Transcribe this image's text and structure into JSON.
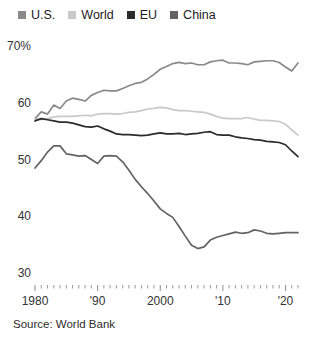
{
  "legend": {
    "items": [
      {
        "label": "U.S.",
        "color": "#8a8a8a",
        "key": "us"
      },
      {
        "label": "World",
        "color": "#c9c9c9",
        "key": "world"
      },
      {
        "label": "EU",
        "color": "#2b2b2b",
        "key": "eu"
      },
      {
        "label": "China",
        "color": "#636363",
        "key": "china"
      }
    ]
  },
  "source": "Source: World Bank",
  "chart_data": {
    "type": "line",
    "title": "",
    "subtitle": "",
    "xlabel": "",
    "ylabel": "",
    "xlim": [
      1980,
      2022
    ],
    "ylim": [
      30,
      70
    ],
    "grid": false,
    "legend_position": "top-left",
    "y_ticks": [
      {
        "value": 70,
        "label": "70%"
      },
      {
        "value": 60,
        "label": "60"
      },
      {
        "value": 50,
        "label": "50"
      },
      {
        "value": 40,
        "label": "40"
      },
      {
        "value": 30,
        "label": "30"
      }
    ],
    "x_ticks": [
      {
        "value": 1980,
        "label": "1980"
      },
      {
        "value": 1990,
        "label": "'90"
      },
      {
        "value": 2000,
        "label": "2000"
      },
      {
        "value": 2010,
        "label": "'10"
      },
      {
        "value": 2020,
        "label": "'20"
      }
    ],
    "x": [
      1980,
      1981,
      1982,
      1983,
      1984,
      1985,
      1986,
      1987,
      1988,
      1989,
      1990,
      1991,
      1992,
      1993,
      1994,
      1995,
      1996,
      1997,
      1998,
      1999,
      2000,
      2001,
      2002,
      2003,
      2004,
      2005,
      2006,
      2007,
      2008,
      2009,
      2010,
      2011,
      2012,
      2013,
      2014,
      2015,
      2016,
      2017,
      2018,
      2019,
      2020,
      2021,
      2022
    ],
    "series": [
      {
        "name": "U.S.",
        "color": "#8a8a8a",
        "values": [
          57.2,
          58.4,
          58.0,
          59.6,
          59.0,
          60.3,
          60.8,
          60.6,
          60.3,
          61.3,
          61.8,
          62.2,
          62.1,
          62.1,
          62.5,
          63.0,
          63.4,
          63.6,
          64.2,
          65.0,
          65.9,
          66.4,
          66.9,
          67.1,
          66.9,
          67.0,
          66.7,
          66.7,
          67.2,
          67.4,
          67.5,
          67.0,
          67.0,
          66.9,
          66.7,
          67.2,
          67.3,
          67.4,
          67.4,
          67.1,
          66.3,
          65.6,
          67.0
        ]
      },
      {
        "name": "World",
        "color": "#c9c9c9",
        "values": [
          57.2,
          57.0,
          57.2,
          57.5,
          57.6,
          57.6,
          57.6,
          57.7,
          57.8,
          57.7,
          58.0,
          58.1,
          58.1,
          58.0,
          58.1,
          58.3,
          58.4,
          58.6,
          58.9,
          59.0,
          59.2,
          59.1,
          58.8,
          58.6,
          58.6,
          58.5,
          58.4,
          58.3,
          58.0,
          57.6,
          57.3,
          57.2,
          57.2,
          57.2,
          57.4,
          57.1,
          56.9,
          56.9,
          56.8,
          56.7,
          56.2,
          55.2,
          54.3
        ]
      },
      {
        "name": "EU",
        "color": "#2b2b2b",
        "values": [
          56.8,
          57.2,
          57.0,
          56.8,
          56.6,
          56.6,
          56.4,
          56.1,
          55.8,
          55.7,
          55.9,
          55.4,
          55.0,
          54.5,
          54.4,
          54.4,
          54.3,
          54.2,
          54.3,
          54.5,
          54.7,
          54.5,
          54.5,
          54.6,
          54.4,
          54.5,
          54.6,
          54.8,
          54.9,
          54.4,
          54.3,
          54.3,
          54.0,
          53.8,
          53.7,
          53.5,
          53.4,
          53.2,
          53.1,
          53.0,
          52.6,
          51.5,
          50.5
        ]
      },
      {
        "name": "China",
        "color": "#636363",
        "values": [
          48.5,
          49.8,
          51.3,
          52.4,
          52.4,
          51.0,
          50.8,
          50.6,
          50.7,
          50.0,
          49.3,
          50.6,
          50.7,
          50.6,
          49.6,
          48.1,
          46.5,
          45.2,
          44.0,
          42.7,
          41.3,
          40.5,
          39.8,
          38.2,
          36.5,
          34.9,
          34.3,
          34.6,
          35.8,
          36.3,
          36.6,
          36.9,
          37.2,
          37.0,
          37.1,
          37.6,
          37.4,
          37.0,
          36.9,
          37.0,
          37.1,
          37.1,
          37.1
        ]
      }
    ]
  }
}
